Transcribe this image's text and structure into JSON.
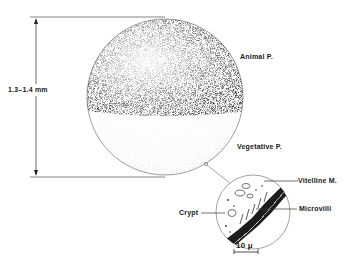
{
  "diagram": {
    "type": "egg-cell-illustration",
    "labels": {
      "diameter": "1.3–1.4 mm",
      "animal_pole": "Animal P.",
      "vegetative_pole": "Vegetative P.",
      "vitelline_membrane": "Vitelline M.",
      "microvilli": "Microvilli",
      "crypt": "Crypt",
      "scale_bar": "10 μ"
    },
    "colors": {
      "line": "#555555",
      "stipple_dark": "#222222",
      "background": "#ffffff"
    }
  }
}
